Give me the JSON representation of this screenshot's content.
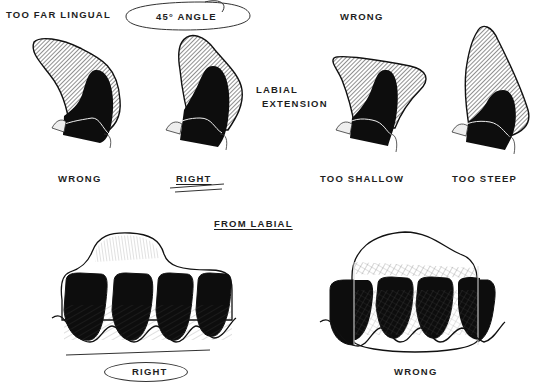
{
  "top_labels": {
    "too_far_lingual": "TOO FAR LINGUAL",
    "angle": "45° ANGLE",
    "wrong_header": "WRONG",
    "labial_extension_line1": "LABIAL",
    "labial_extension_line2": "EXTENSION"
  },
  "profile_captions": [
    {
      "label": "WRONG"
    },
    {
      "label": "RIGHT"
    },
    {
      "label": "TOO SHALLOW"
    },
    {
      "label": "TOO STEEP"
    }
  ],
  "section_title": "FROM LABIAL",
  "labial_captions": {
    "left": "RIGHT",
    "right": "WRONG"
  },
  "colors": {
    "ink": "#1a1a1a",
    "tooth": "#0d0d0d",
    "background": "#ffffff"
  }
}
